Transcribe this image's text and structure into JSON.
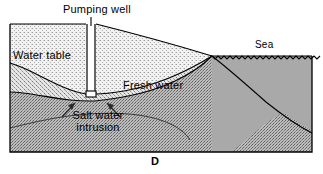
{
  "figure": {
    "panel_letter": "D",
    "title_label": "Pumping well",
    "labels": {
      "pumping_well": "Pumping well",
      "water_table": "Water table",
      "fresh_water": "Fresh water",
      "sea": "Sea",
      "salt_water_intrusion": "Salt water intrusion"
    },
    "colors": {
      "outline": "#000000",
      "fresh_water_fill": "#e9e9e9",
      "salt_water_fill": "#b9b9b9",
      "sea_fill": "#a9a9a9",
      "unsaturated_fill": "#efefef",
      "background": "#ffffff",
      "text": "#000000"
    },
    "geometry": {
      "frame_left": 10,
      "frame_right": 312,
      "frame_top": 24,
      "frame_bottom": 152,
      "sea_level_y": 56,
      "shoreline_x": 212,
      "well_x": 91,
      "well_left": 87,
      "well_right": 95,
      "well_bottom_y": 94
    },
    "annotations": {
      "arrow_left": "salt-intrusion-arrow-left",
      "arrow_right": "salt-intrusion-arrow-right",
      "leader_line": "pumping-well-leader-line",
      "sea_surface": "sea-surface-wave-line"
    }
  }
}
